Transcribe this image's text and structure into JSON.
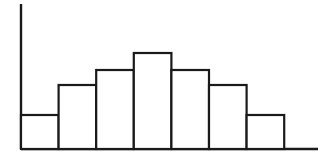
{
  "chart_data": {
    "type": "bar",
    "title": "",
    "subtitle": "",
    "xlabel": "",
    "ylabel": "",
    "categories": [
      "1",
      "2",
      "3",
      "4",
      "5",
      "6",
      "7"
    ],
    "values": [
      34,
      64,
      79,
      96,
      79,
      64,
      34
    ],
    "series": [
      {
        "name": "frequency",
        "values": [
          34,
          64,
          79,
          96,
          79,
          64,
          34
        ]
      }
    ],
    "ylim": [
      0,
      145
    ],
    "xlim": [
      0,
      7
    ],
    "grid": false,
    "legend": null,
    "legend_position": "none",
    "tick_labels_x": [],
    "tick_labels_y": [],
    "annotations": [],
    "bar_fill_color": "#ffffff",
    "bar_edge_color": "#1a1a1a",
    "axis_color": "#1a1a1a",
    "background_color": "#ffffff"
  },
  "geometry": {
    "baseline_y": 149,
    "axis_x": 21,
    "axis_top_y": 4,
    "baseline_right_x": 318,
    "bar_left_x": 21,
    "bar_width": 37.6,
    "bar_tops_y": [
      115,
      85,
      70,
      53,
      70,
      85,
      115
    ]
  }
}
